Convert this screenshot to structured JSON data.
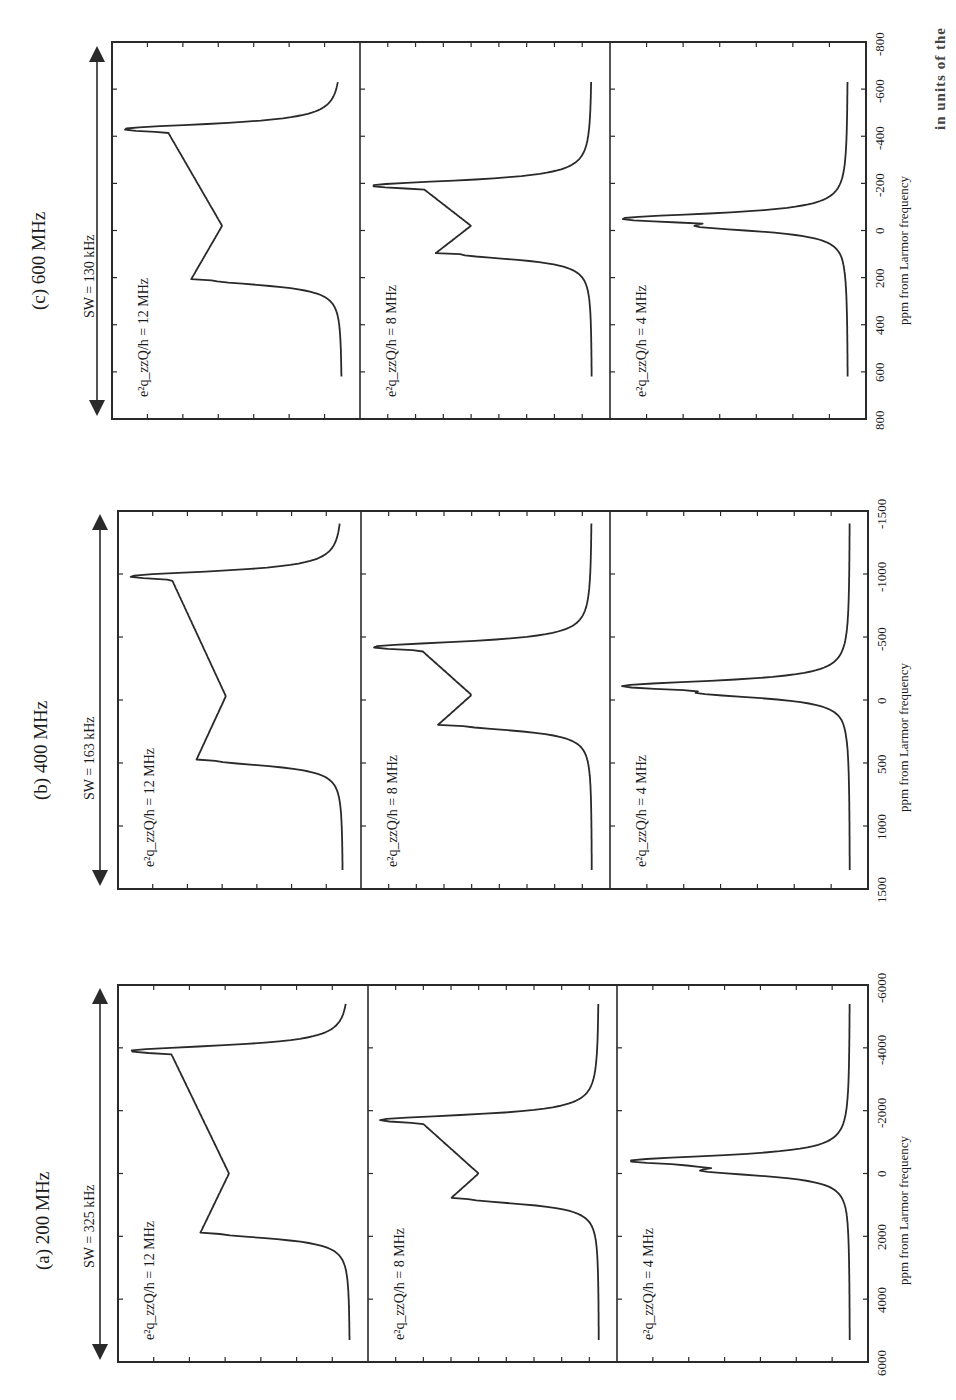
{
  "figure": {
    "caption_fragment": "in units of the"
  },
  "chart_data": [
    {
      "type": "line",
      "panel_id": "a",
      "title": "(a) 200 MHz",
      "sweep_width": "SW = 325 kHz",
      "xlabel": "ppm from Larmor frequency",
      "ylabel": "",
      "xlim": [
        6000,
        -6000
      ],
      "x_ticks": [
        "6000",
        "4000",
        "2000",
        "0",
        "-2000",
        "-4000",
        "-6000"
      ],
      "grid": false,
      "legend": "none",
      "series": [
        {
          "name": "e2qzzQ/h = 12 MHz",
          "label": "e²q_zzQ/h = 12 MHz",
          "peaks": {
            "horn_low": 1900,
            "horn_high": -3900,
            "dip": 0,
            "baseline_from": 5300,
            "baseline_to": -5400
          }
        },
        {
          "name": "e2qzzQ/h = 8 MHz",
          "label": "e²q_zzQ/h = 8 MHz",
          "peaks": {
            "horn_low": 800,
            "horn_high": -1700,
            "dip": 0,
            "baseline_from": 5300,
            "baseline_to": -5400
          }
        },
        {
          "name": "e2qzzQ/h = 4 MHz",
          "label": "e²q_zzQ/h = 4 MHz",
          "peaks": {
            "horn_low": -100,
            "horn_high": -400,
            "dip": -100,
            "baseline_from": 5300,
            "baseline_to": -5400
          }
        }
      ]
    },
    {
      "type": "line",
      "panel_id": "b",
      "title": "(b) 400 MHz",
      "sweep_width": "SW = 163 kHz",
      "xlabel": "ppm from Larmor frequency",
      "ylabel": "",
      "xlim": [
        1500,
        -1500
      ],
      "x_ticks": [
        "1500",
        "1000",
        "500",
        "0",
        "-500",
        "-1000",
        "-1500"
      ],
      "grid": false,
      "legend": "none",
      "series": [
        {
          "name": "e2qzzQ/h = 12 MHz",
          "label": "e²q_zzQ/h = 12 MHz",
          "peaks": {
            "horn_low": 480,
            "horn_high": -980,
            "dip": -30,
            "baseline_from": 1350,
            "baseline_to": -1400
          }
        },
        {
          "name": "e2qzzQ/h = 8 MHz",
          "label": "e²q_zzQ/h = 8 MHz",
          "peaks": {
            "horn_low": 200,
            "horn_high": -420,
            "dip": -40,
            "baseline_from": 1350,
            "baseline_to": -1400
          }
        },
        {
          "name": "e2qzzQ/h = 4 MHz",
          "label": "e²q_zzQ/h = 4 MHz",
          "peaks": {
            "horn_low": -60,
            "horn_high": -110,
            "dip": -50,
            "baseline_from": 1350,
            "baseline_to": -1400
          }
        }
      ]
    },
    {
      "type": "line",
      "panel_id": "c",
      "title": "(c) 600 MHz",
      "sweep_width": "SW = 130 kHz",
      "xlabel": "ppm from Larmor frequency",
      "ylabel": "",
      "xlim": [
        800,
        -800
      ],
      "x_ticks": [
        "800",
        "600",
        "400",
        "200",
        "0",
        "-200",
        "-400",
        "-600",
        "-800"
      ],
      "grid": false,
      "legend": "none",
      "series": [
        {
          "name": "e2qzzQ/h = 12 MHz",
          "label": "e²q_zzQ/h = 12 MHz",
          "peaks": {
            "horn_low": 210,
            "horn_high": -430,
            "dip": -20,
            "baseline_from": 620,
            "baseline_to": -630
          }
        },
        {
          "name": "e2qzzQ/h = 8 MHz",
          "label": "e²q_zzQ/h = 8 MHz",
          "peaks": {
            "horn_low": 100,
            "horn_high": -190,
            "dip": -20,
            "baseline_from": 620,
            "baseline_to": -630
          }
        },
        {
          "name": "e2qzzQ/h = 4 MHz",
          "label": "e²q_zzQ/h = 4 MHz",
          "peaks": {
            "horn_low": -20,
            "horn_high": -50,
            "dip": -30,
            "baseline_from": 620,
            "baseline_to": -630
          }
        }
      ]
    }
  ]
}
